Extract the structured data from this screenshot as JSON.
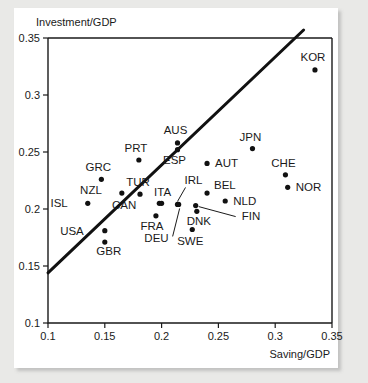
{
  "chart_data": {
    "type": "scatter",
    "title": "",
    "xlabel": "Saving/GDP",
    "ylabel": "Investment/GDP",
    "xlim": [
      0.1,
      0.35
    ],
    "ylim": [
      0.1,
      0.35
    ],
    "xticks": [
      "0.1",
      "0.15",
      "0.2",
      "0.25",
      "0.3",
      "0.35"
    ],
    "yticks": [
      "0.1",
      "0.15",
      "0.2",
      "0.25",
      "0.3",
      "0.35"
    ],
    "xtick_values": [
      0.1,
      0.15,
      0.2,
      0.25,
      0.3,
      0.35
    ],
    "ytick_values": [
      0.1,
      0.15,
      0.2,
      0.25,
      0.3,
      0.35
    ],
    "grid": false,
    "legend": "none",
    "points": [
      {
        "label": "ISL",
        "x": 0.135,
        "y": 0.205,
        "label_dx": -20,
        "label_dy": 4,
        "leader": false
      },
      {
        "label": "NZL",
        "x": 0.165,
        "y": 0.214,
        "label_dx": -20,
        "label_dy": 1,
        "leader": false
      },
      {
        "label": "GRC",
        "x": 0.147,
        "y": 0.226,
        "label_dx": -3,
        "label_dy": -8,
        "leader": false
      },
      {
        "label": "USA",
        "x": 0.15,
        "y": 0.181,
        "label_dx": -21,
        "label_dy": 4,
        "leader": false
      },
      {
        "label": "GBR",
        "x": 0.15,
        "y": 0.171,
        "label_dx": 4,
        "label_dy": 13,
        "leader": false
      },
      {
        "label": "TUR",
        "x": 0.181,
        "y": 0.213,
        "label_dx": -2,
        "label_dy": -8,
        "leader": false
      },
      {
        "label": "PRT",
        "x": 0.18,
        "y": 0.243,
        "label_dx": -3,
        "label_dy": -8,
        "leader": false
      },
      {
        "label": "CAN",
        "x": 0.198,
        "y": 0.205,
        "label_dx": -23,
        "label_dy": 6,
        "leader": false
      },
      {
        "label": "FRA",
        "x": 0.195,
        "y": 0.194,
        "label_dx": -4,
        "label_dy": 14,
        "leader": false
      },
      {
        "label": "AUS",
        "x": 0.214,
        "y": 0.258,
        "label_dx": -2,
        "label_dy": -9,
        "leader": false
      },
      {
        "label": "ESP",
        "x": 0.214,
        "y": 0.252,
        "label_dx": -3,
        "label_dy": 14,
        "leader": false
      },
      {
        "label": "ITA",
        "x": 0.2,
        "y": 0.205,
        "label_dx": 1,
        "label_dy": -7,
        "leader": false
      },
      {
        "label": "IRL",
        "x": 0.214,
        "y": 0.204,
        "label_dx": 7,
        "label_dy": -20,
        "leader": true,
        "leader_path": "M 0 -3 L 8 -17"
      },
      {
        "label": "DEU",
        "x": 0.215,
        "y": 0.204,
        "label_dx": -10,
        "label_dy": 38,
        "leader": true,
        "leader_path": "M 1 4 L -6 32"
      },
      {
        "label": "AUT",
        "x": 0.24,
        "y": 0.24,
        "label_dx": 8,
        "label_dy": 4,
        "leader": false
      },
      {
        "label": "BEL",
        "x": 0.24,
        "y": 0.214,
        "label_dx": 7,
        "label_dy": -4,
        "leader": false
      },
      {
        "label": "NLD",
        "x": 0.256,
        "y": 0.207,
        "label_dx": 8,
        "label_dy": 4,
        "leader": false
      },
      {
        "label": "DNK",
        "x": 0.231,
        "y": 0.198,
        "label_dx": 2,
        "label_dy": 14,
        "leader": false
      },
      {
        "label": "FIN",
        "x": 0.23,
        "y": 0.203,
        "label_dx": 46,
        "label_dy": 14,
        "leader": true,
        "leader_path": "M 3 1 L 40 11"
      },
      {
        "label": "SWE",
        "x": 0.227,
        "y": 0.182,
        "label_dx": -2,
        "label_dy": 15,
        "leader": false
      },
      {
        "label": "JPN",
        "x": 0.28,
        "y": 0.253,
        "label_dx": -2,
        "label_dy": -8,
        "leader": false
      },
      {
        "label": "CHE",
        "x": 0.309,
        "y": 0.23,
        "label_dx": -2,
        "label_dy": -8,
        "leader": false
      },
      {
        "label": "NOR",
        "x": 0.311,
        "y": 0.219,
        "label_dx": 8,
        "label_dy": 4,
        "leader": false
      },
      {
        "label": "KOR",
        "x": 0.335,
        "y": 0.322,
        "label_dx": -2,
        "label_dy": -9,
        "leader": false
      }
    ],
    "fit_line": {
      "x_start": 0.1,
      "y_start": 0.144,
      "x_end": 0.325,
      "y_end": 0.357,
      "description": "regression line"
    }
  },
  "colors": {
    "background": "#e9e9e7",
    "card": "#ffffff",
    "ink": "#1a1a1a",
    "marker": "#111111"
  }
}
